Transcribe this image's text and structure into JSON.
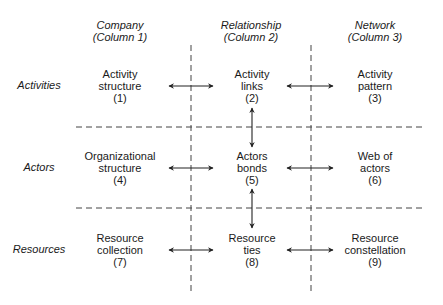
{
  "columns": [
    {
      "title": "Company",
      "subtitle": "(Column 1)"
    },
    {
      "title": "Relationship",
      "subtitle": "(Column 2)"
    },
    {
      "title": "Network",
      "subtitle": "(Column 3)"
    }
  ],
  "rows": [
    {
      "label": "Activities"
    },
    {
      "label": "Actors"
    },
    {
      "label": "Resources"
    }
  ],
  "cells": [
    [
      {
        "line1": "Activity",
        "line2": "structure",
        "num": "(1)"
      },
      {
        "line1": "Activity",
        "line2": "links",
        "num": "(2)"
      },
      {
        "line1": "Activity",
        "line2": "pattern",
        "num": "(3)"
      }
    ],
    [
      {
        "line1": "Organizational",
        "line2": "structure",
        "num": "(4)"
      },
      {
        "line1": "Actors",
        "line2": "bonds",
        "num": "(5)"
      },
      {
        "line1": "Web of",
        "line2": "actors",
        "num": "(6)"
      }
    ],
    [
      {
        "line1": "Resource",
        "line2": "collection",
        "num": "(7)"
      },
      {
        "line1": "Resource",
        "line2": "ties",
        "num": "(8)"
      },
      {
        "line1": "Resource",
        "line2": "constellation",
        "num": "(9)"
      }
    ]
  ],
  "colors": {
    "line": "#333333",
    "text": "#1a1a1a",
    "background": "#ffffff"
  }
}
